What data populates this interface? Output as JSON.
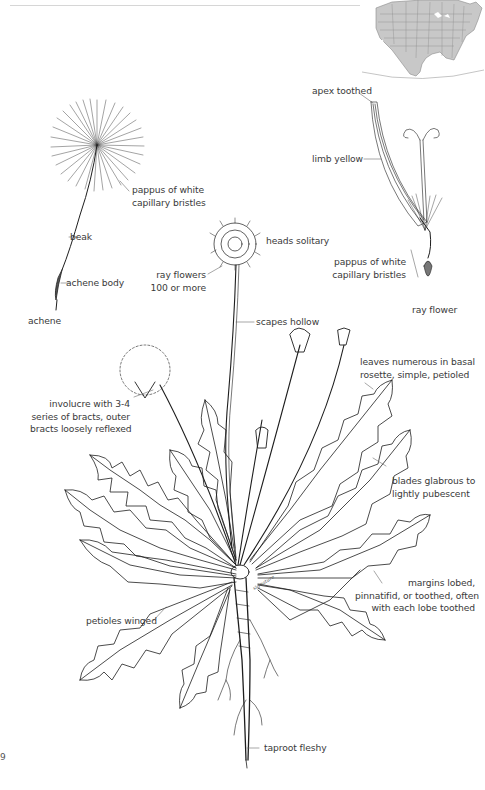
{
  "page": {
    "page_number_fragment": "9"
  },
  "range_map": {
    "region": "North America",
    "fill_color": "#c8c8c8",
    "border_color": "#7a7a7a"
  },
  "labels": {
    "apex_toothed": "apex toothed",
    "limb_yellow": "limb yellow",
    "pappus_seed_line1": "pappus of white",
    "pappus_seed_line2": "capillary bristles",
    "beak": "beak",
    "achene_body": "achene body",
    "achene": "achene",
    "heads_solitary": "heads solitary",
    "ray_flowers_line1": "ray flowers",
    "ray_flowers_line2": "100 or more",
    "scapes_hollow": "scapes hollow",
    "pappus_ray_line1": "pappus of white",
    "pappus_ray_line2": "capillary bristles",
    "ray_flower": "ray flower",
    "leaves_line1": "leaves numerous in basal",
    "leaves_line2": "rosette, simple, petioled",
    "involucre_line1": "involucre with 3-4",
    "involucre_line2": "series of bracts, outer",
    "involucre_line3": "bracts loosely reflexed",
    "blades_line1": "blades glabrous to",
    "blades_line2": "lightly pubescent",
    "margins_line1": "margins lobed,",
    "margins_line2": "pinnatifid, or toothed, often",
    "margins_line3": "with each lobe toothed",
    "petioles_winged": "petioles winged",
    "taproot_fleshy": "taproot fleshy"
  },
  "colors": {
    "ink": "#1e1e1e",
    "label_text": "#3a3a3a",
    "leader_line": "#6b6b6b",
    "background": "#ffffff"
  }
}
